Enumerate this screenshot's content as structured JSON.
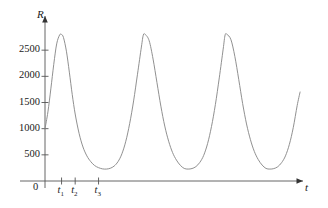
{
  "chart_data": {
    "type": "line",
    "title": "",
    "xlabel": "t",
    "ylabel": "R",
    "origin_label": "0",
    "grid": false,
    "legend": null,
    "line_color": "#8a8a8a",
    "axis_color": "#555555",
    "background_color": "#ffffff",
    "ylim": [
      0,
      3000
    ],
    "xlim": [
      0,
      265
    ],
    "yticks": [
      500,
      1000,
      1500,
      2000,
      2500
    ],
    "ytick_labels": [
      "500",
      "1000",
      "1500",
      "2000",
      "2500"
    ],
    "xticks": [
      17,
      31,
      55
    ],
    "xtick_labels": [
      "t",
      "t",
      "t"
    ],
    "xtick_subscripts": [
      "1",
      "2",
      "3"
    ],
    "baseline": 230,
    "peak_value": 2800,
    "valley_value": 230,
    "period": 84,
    "start_value": 1000,
    "peaks_x": [
      17,
      101,
      185
    ],
    "valleys_x": [
      59,
      143,
      227
    ],
    "series": [
      {
        "name": "R(t)",
        "x": [
          0,
          3,
          6,
          9,
          12,
          15,
          17,
          19,
          22,
          25,
          28,
          31,
          35,
          39,
          43,
          47,
          51,
          55,
          59,
          63,
          67,
          71,
          75,
          79,
          83,
          87,
          91,
          95,
          99,
          101,
          103,
          107,
          111,
          115,
          119,
          123,
          127,
          131,
          135,
          139,
          143,
          147,
          151,
          155,
          159,
          163,
          167,
          171,
          175,
          179,
          183,
          185,
          187,
          191,
          195,
          199,
          203,
          207,
          211,
          215,
          219,
          223,
          227,
          231,
          235,
          239,
          243,
          247,
          251,
          255,
          259,
          262
        ],
        "y": [
          1000,
          1320,
          1760,
          2230,
          2620,
          2790,
          2800,
          2740,
          2480,
          2080,
          1650,
          1280,
          910,
          650,
          480,
          370,
          295,
          255,
          232,
          228,
          243,
          285,
          370,
          520,
          760,
          1100,
          1530,
          2040,
          2560,
          2790,
          2800,
          2680,
          2330,
          1880,
          1430,
          1050,
          760,
          545,
          400,
          300,
          240,
          228,
          238,
          275,
          355,
          490,
          715,
          1040,
          1460,
          1970,
          2520,
          2790,
          2800,
          2700,
          2380,
          1940,
          1480,
          1090,
          790,
          565,
          410,
          305,
          240,
          228,
          237,
          272,
          350,
          480,
          700,
          1020,
          1440,
          1700
        ]
      }
    ]
  },
  "axes": {
    "y_axis_label": "R",
    "x_axis_label": "t",
    "origin": "0"
  }
}
